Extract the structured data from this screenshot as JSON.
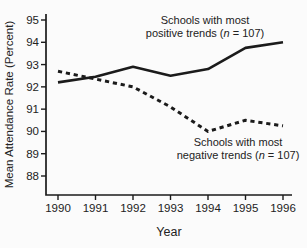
{
  "figure": {
    "background": "#fbfbfb",
    "line_color": "#1b1b1b",
    "text_color": "#222222"
  },
  "chart_data": {
    "type": "line",
    "title": "",
    "xlabel": "Year",
    "ylabel": "Mean Attendance Rate (Percent)",
    "x": [
      1990,
      1991,
      1992,
      1993,
      1994,
      1995,
      1996
    ],
    "xtick_labels": [
      "1990",
      "1991",
      "1992",
      "1993",
      "1994",
      "1995",
      "1996"
    ],
    "ylim": [
      88,
      95
    ],
    "yticks": [
      95,
      94,
      93,
      92,
      91,
      90,
      89,
      88
    ],
    "grid": false,
    "legend_position": "inline-annotations",
    "series": [
      {
        "name": "Schools with most positive trends (n = 107)",
        "style": "solid",
        "n": 107,
        "values": [
          92.2,
          92.45,
          92.9,
          92.5,
          92.8,
          93.75,
          94.0
        ]
      },
      {
        "name": "Schools with most negative trends (n = 107)",
        "style": "dashed",
        "n": 107,
        "values": [
          92.7,
          92.35,
          92.0,
          91.1,
          90.0,
          90.5,
          90.25
        ]
      }
    ],
    "annotations": [
      {
        "id": "positive-label",
        "lines": [
          [
            "Schools with most"
          ],
          [
            "positive trends (",
            "n",
            " = 107)"
          ]
        ],
        "x": 205,
        "y": 24
      },
      {
        "id": "negative-label",
        "lines": [
          [
            "Schools with most"
          ],
          [
            "negative trends (",
            "n",
            " = 107)"
          ]
        ],
        "x": 238,
        "y": 146
      }
    ]
  }
}
